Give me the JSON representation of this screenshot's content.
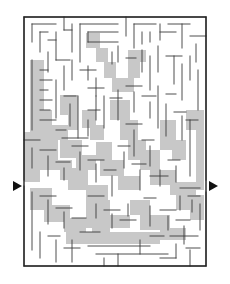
{
  "puzzle": {
    "type": "maze",
    "colors": {
      "wall": "#3a3a3a",
      "border": "#222222",
      "shade": "#c8c8c8",
      "background": "#ffffff",
      "arrow": "#111111"
    },
    "frame": {
      "x": 24,
      "y": 17,
      "width": 182,
      "height": 249
    },
    "grid": {
      "cols": 24,
      "rows": 33,
      "cell": 7.58
    },
    "entrance": {
      "side": "left",
      "y": 186,
      "icon": "arrow-right-icon"
    },
    "exit": {
      "side": "right",
      "y": 186,
      "icon": "arrow-right-icon"
    },
    "shaded_regions": [
      "M30,60 L44,60 L44,110 L52,110 L52,125 L68,125 L68,140 L58,140 L58,150 L44,150 L44,140 L30,140 Z",
      "M24,132 L44,132 L44,150 L58,150 L58,160 L72,160 L72,180 L60,180 L60,170 L40,170 L40,182 L24,182 Z",
      "M60,95 L78,95 L78,130 L68,130 L68,115 L60,115 Z",
      "M86,33 L100,33 L100,48 L108,48 L108,62 L116,62 L116,78 L124,78 L124,92 L112,92 L112,78 L104,78 L104,62 L96,62 L96,48 L86,48 Z",
      "M128,50 L146,50 L146,62 L140,62 L140,78 L134,78 L134,92 L122,92 L122,78 L128,78 Z",
      "M110,100 L130,100 L130,120 L138,120 L138,140 L146,140 L146,160 L128,160 L128,140 L120,140 L120,120 L110,120 Z",
      "M82,110 L96,110 L96,125 L104,125 L104,140 L90,140 L90,128 L82,128 Z",
      "M60,140 L82,140 L82,155 L96,155 L96,170 L76,170 L76,158 L60,158 Z",
      "M96,142 L112,142 L112,160 L124,160 L124,176 L140,176 L140,190 L118,190 L118,176 L100,176 L100,160 L96,160 Z",
      "M140,150 L160,150 L160,170 L176,170 L176,182 L196,182 L196,195 L170,195 L170,185 L150,185 L150,170 L140,170 Z",
      "M186,110 L204,110 L204,190 L196,190 L196,130 L186,130 Z",
      "M160,120 L176,120 L176,140 L186,140 L186,160 L172,160 L172,150 L160,150 Z",
      "M30,188 L52,188 L52,205 L70,205 L70,218 L86,218 L86,232 L64,232 L64,222 L44,222 L44,210 L30,210 Z",
      "M86,200 L110,200 L110,215 L130,215 L130,228 L110,228 L110,244 L92,244 L92,228 L86,228 Z",
      "M130,200 L150,200 L150,215 L170,215 L170,228 L186,228 L186,240 L160,240 L160,230 L140,230 L140,215 L130,215 Z",
      "M176,195 L204,195 L204,220 L190,220 L190,210 L176,210 Z",
      "M66,232 L160,232 L160,244 L66,244 Z",
      "M68,168 L88,168 L88,185 L108,185 L108,200 L86,200 L86,190 L68,190 Z"
    ],
    "walls": [
      "M32,24 L56,24 M32,24 L32,42 M40,32 L40,52 M40,32 L48,32 M48,40 L56,40 M56,32 L56,60",
      "M64,17 L64,30 M64,30 L72,30 M72,24 L72,52 M80,24 L80,62 M80,24 L118,24 M88,32 L118,32 M88,32 L88,42 M88,42 L118,42",
      "M126,17 L126,36 M134,24 L156,24 M134,24 L134,48 M142,32 L142,44 M150,32 L150,42 M160,24 L160,40 M160,32 L176,32 M168,24 L190,24 M182,24 L182,48 M190,36 L206,36 M196,44 L196,62",
      "M48,52 L48,72 M56,60 L70,60 M64,66 L64,90 M72,60 L72,80 M80,70 L96,70 M88,66 L88,80 M96,78 L96,96",
      "M112,52 L112,64 M118,46 L118,62 M126,58 L136,58 M142,50 L142,72 M150,56 L150,90 M158,46 L158,72 M166,56 L182,56 M174,56 L174,84 M182,64 L182,100 M190,56 L190,80 M198,70 L198,110",
      "M32,60 L32,130 M40,70 L48,70 M40,80 L52,80 M40,90 L48,90 M40,100 L52,100 M40,110 L50,110 M40,120 L56,120",
      "M56,80 L56,118 M64,96 L76,96 M70,104 L70,126 M78,96 L78,138 M56,130 L66,130 M62,138 L88,138",
      "M88,88 L104,88 M96,96 L96,120 M104,96 L104,128 M88,110 L100,110 M88,120 L88,136 M110,98 L122,98 M118,90 L118,120",
      "M126,86 L142,86 M134,92 L134,112 M142,96 L156,96 M150,102 L150,118 M158,86 L158,128 M166,94 L176,94 M166,104 L166,136 M174,112 L186,112 M182,116 L182,140",
      "M126,124 L142,124 M134,130 L134,156 M142,140 L154,140 M150,146 L150,166 M186,120 L198,120 M190,120 L190,176",
      "M24,140 L40,140 M32,148 L32,168 M40,150 L56,150 M48,156 L48,176 M56,162 L70,162 M64,168 L64,180",
      "M72,146 L88,146 M80,152 L80,170 M88,160 L104,160 M96,164 L96,182 M104,170 L116,170 M112,176 L112,196",
      "M118,146 L130,146 M124,152 L124,168 M132,164 L146,164 M140,170 L140,190 M150,176 L168,176 M160,170 L160,186 M168,160 L180,160 M176,166 L176,182",
      "M32,192 L32,250 M40,196 L56,196 M48,200 L48,224 M56,208 L72,208 M64,212 L64,228 M72,218 L86,218",
      "M40,232 L40,258 M48,236 L60,236 M56,240 L56,262 M64,248 L80,248 M72,240 L72,262 M80,232 L100,232",
      "M88,196 L104,196 M96,204 L96,218 M104,210 L120,210 M112,214 L112,228 M120,220 L136,220 M128,204 L128,216",
      "M88,246 L150,246 M96,254 L168,254 M104,258 L104,266 M118,254 L118,266 M140,240 L140,254 M150,236 L164,236",
      "M144,198 L156,198 M150,206 L150,226 M160,210 L176,210 M168,216 L168,230 M176,220 L190,220 M184,226 L184,244",
      "M170,236 L198,236 M176,244 L176,258 M186,248 L200,248 M190,250 L190,266 M160,258 L176,258 M200,204 L200,230",
      "M180,188 L200,188 M188,196 L200,196 M192,200 L192,212 M180,196 L180,210",
      "M24,186 L24,266 M24,266 L206,266 M206,17 L206,180 M206,192 L206,266 M24,17 L206,17 M24,17 L24,180"
    ]
  }
}
